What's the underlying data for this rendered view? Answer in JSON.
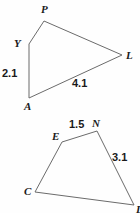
{
  "canvas": {
    "width": 140,
    "height": 213,
    "background": "#fefefe",
    "stroke_color": "#6b6b6b",
    "text_color": "#1a1a1a"
  },
  "figures": [
    {
      "name": "quadrilateral-pyal",
      "vertices": [
        {
          "label": "P",
          "x": 44,
          "y": 21,
          "label_x": 41,
          "label_y": 4
        },
        {
          "label": "Y",
          "x": 29,
          "y": 44,
          "label_x": 14,
          "label_y": 38
        },
        {
          "label": "A",
          "x": 29,
          "y": 98,
          "label_x": 24,
          "label_y": 101
        },
        {
          "label": "L",
          "x": 122,
          "y": 55,
          "label_x": 126,
          "label_y": 50
        }
      ],
      "side_labels": [
        {
          "text": "2.1",
          "x": 2,
          "y": 68
        },
        {
          "text": "4.1",
          "x": 72,
          "y": 78
        }
      ]
    },
    {
      "name": "quadrilateral-enlc",
      "vertices": [
        {
          "label": "E",
          "x": 62,
          "y": 142,
          "label_x": 52,
          "label_y": 131
        },
        {
          "label": "N",
          "x": 97,
          "y": 131,
          "label_x": 92,
          "label_y": 118
        },
        {
          "label": "L",
          "x": 134,
          "y": 205,
          "label_x": 136,
          "label_y": 204
        },
        {
          "label": "C",
          "x": 35,
          "y": 192,
          "label_x": 24,
          "label_y": 186
        }
      ],
      "side_labels": [
        {
          "text": "1.5",
          "x": 69,
          "y": 119
        },
        {
          "text": "3.1",
          "x": 112,
          "y": 152
        }
      ]
    }
  ]
}
